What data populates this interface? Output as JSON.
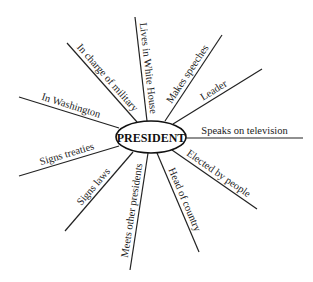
{
  "diagram": {
    "title": "PRESIDENT",
    "type": "concept-web",
    "center": {
      "label": "PRESIDENT",
      "cx": 151,
      "cy": 137,
      "rx": 35,
      "ry": 16
    },
    "spokes": [
      {
        "label": "Lives in White House",
        "x1": 147,
        "y1": 121,
        "x2": 135,
        "y2": 17
      },
      {
        "label": "In charge of military",
        "x1": 137,
        "y1": 122,
        "x2": 67,
        "y2": 43
      },
      {
        "label": "In Washington",
        "x1": 119,
        "y1": 128,
        "x2": 19,
        "y2": 97
      },
      {
        "label": "Signs treaties",
        "x1": 119,
        "y1": 146,
        "x2": 19,
        "y2": 176
      },
      {
        "label": "Signs laws",
        "x1": 133,
        "y1": 152,
        "x2": 65,
        "y2": 231
      },
      {
        "label": "Meets other presidents",
        "x1": 148,
        "y1": 153,
        "x2": 130,
        "y2": 270
      },
      {
        "label": "Head of country",
        "x1": 157,
        "y1": 153,
        "x2": 199,
        "y2": 252
      },
      {
        "label": "Elected by people",
        "x1": 172,
        "y1": 150,
        "x2": 257,
        "y2": 209
      },
      {
        "label": "Speaks on television",
        "x1": 186,
        "y1": 138,
        "x2": 303,
        "y2": 138
      },
      {
        "label": "Leader",
        "x1": 173,
        "y1": 124,
        "x2": 262,
        "y2": 69
      },
      {
        "label": "Makes speeches",
        "x1": 165,
        "y1": 121,
        "x2": 222,
        "y2": 35
      }
    ]
  }
}
